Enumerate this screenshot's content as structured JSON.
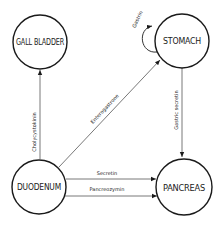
{
  "nodes": {
    "gall_bladder": {
      "label": "GALL BLADDER"
    },
    "stomach": {
      "label": "STOMACH"
    },
    "duodenum": {
      "label": "DUODENUM"
    },
    "pancreas": {
      "label": "PANCREAS"
    }
  },
  "edges": {
    "cholecystokinin": {
      "label": "Cholycystokinin",
      "from": "DUODENUM",
      "to": "GALL BLADDER"
    },
    "enterogastrone": {
      "label": "Enterogastrone",
      "from": "DUODENUM",
      "to": "STOMACH"
    },
    "gastrin": {
      "label": "Gastrin",
      "from": "STOMACH",
      "to": "STOMACH"
    },
    "gastric_secretin": {
      "label": "Gastric secretin",
      "from": "STOMACH",
      "to": "PANCREAS"
    },
    "secretin": {
      "label": "Secretin",
      "from": "DUODENUM",
      "to": "PANCREAS"
    },
    "pancreozymin": {
      "label": "Pancreozymin",
      "from": "DUODENUM",
      "to": "PANCREAS"
    }
  }
}
